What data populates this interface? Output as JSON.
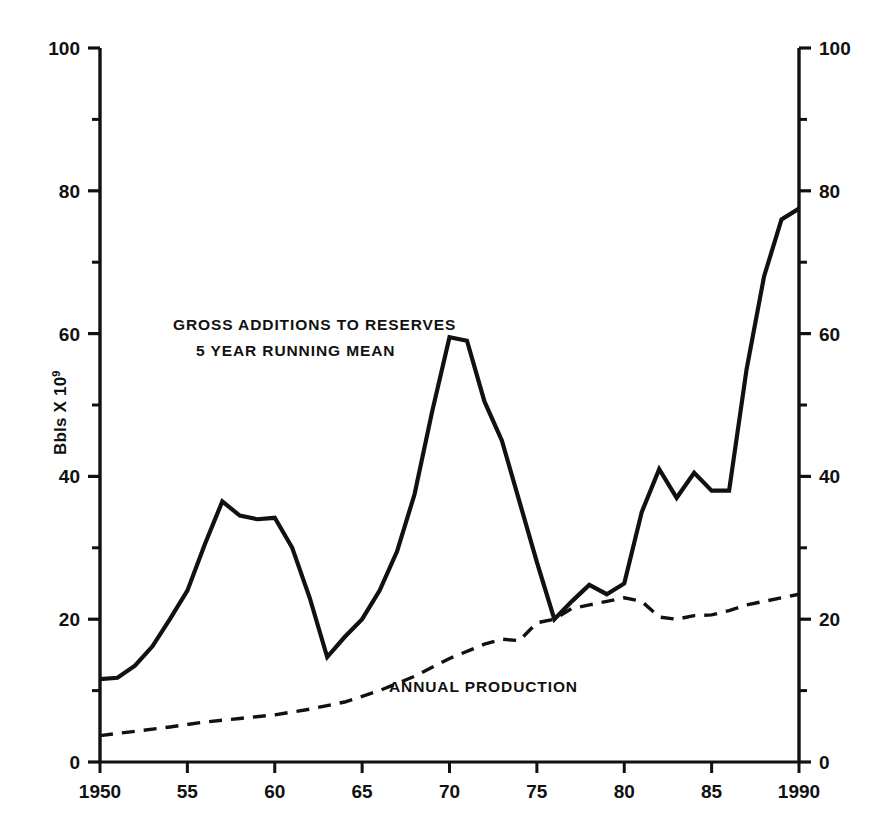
{
  "chart_data": {
    "type": "line",
    "title": "",
    "xlabel": "",
    "ylabel": "Bbls X 10",
    "ylabel_superscript": "9",
    "xlim": [
      1950,
      1990
    ],
    "ylim": [
      0,
      100
    ],
    "xticks": [
      1950,
      1955,
      1960,
      1965,
      1970,
      1975,
      1980,
      1985,
      1990
    ],
    "xticklabels": [
      "1950",
      "55",
      "60",
      "65",
      "70",
      "75",
      "80",
      "85",
      "1990"
    ],
    "yticks": [
      0,
      20,
      40,
      60,
      80,
      100
    ],
    "yticklabels": [
      "0",
      "20",
      "40",
      "60",
      "80",
      "100"
    ],
    "yminorticks": [
      10,
      30,
      50,
      70,
      90
    ],
    "grid": false,
    "legend": "none",
    "dual_y_axis": true,
    "right_axis_same_scale": true,
    "annotations": [
      {
        "name": "series-label-gross-additions",
        "text_line1": "GROSS ADDITIONS TO RESERVES",
        "text_line2": "5 YEAR RUNNING MEAN",
        "x": 1956.5,
        "y": 63.5
      },
      {
        "name": "series-label-annual-production",
        "text": "ANNUAL PRODUCTION",
        "x": 1971.0,
        "y": 10.5
      }
    ],
    "series": [
      {
        "name": "GROSS ADDITIONS TO RESERVES 5 YEAR RUNNING MEAN",
        "style": "solid",
        "x": [
          1950,
          1951,
          1952,
          1953,
          1954,
          1955,
          1956,
          1957,
          1958,
          1959,
          1960,
          1961,
          1962,
          1963,
          1964,
          1965,
          1966,
          1967,
          1968,
          1969,
          1970,
          1971,
          1972,
          1973,
          1974,
          1975,
          1976,
          1977,
          1978,
          1979,
          1980,
          1981,
          1982,
          1983,
          1984,
          1985,
          1986,
          1987,
          1988,
          1989,
          1990
        ],
        "values": [
          11.6,
          11.8,
          13.5,
          16.2,
          20.0,
          24.0,
          30.5,
          36.5,
          34.5,
          34.0,
          34.2,
          30.0,
          23.0,
          14.7,
          17.5,
          20.0,
          24.0,
          29.5,
          37.5,
          49.0,
          59.5,
          59.0,
          50.5,
          45.0,
          36.5,
          28.0,
          20.0,
          22.5,
          24.8,
          23.5,
          25.0,
          35.0,
          41.0,
          37.0,
          40.5,
          38.0,
          38.0,
          55.0,
          68.0,
          76.0,
          77.5
        ]
      },
      {
        "name": "ANNUAL PRODUCTION",
        "style": "dashed",
        "x": [
          1950,
          1952,
          1954,
          1956,
          1958,
          1960,
          1962,
          1964,
          1966,
          1968,
          1970,
          1972,
          1973,
          1974,
          1975,
          1976,
          1977,
          1978,
          1979,
          1980,
          1981,
          1982,
          1983,
          1984,
          1985,
          1986,
          1987,
          1988,
          1989,
          1990
        ],
        "values": [
          3.7,
          4.3,
          4.9,
          5.6,
          6.1,
          6.6,
          7.4,
          8.4,
          10.0,
          12.0,
          14.5,
          16.5,
          17.2,
          17.0,
          19.5,
          20.0,
          21.5,
          22.0,
          22.5,
          23.0,
          22.5,
          20.3,
          20.0,
          20.5,
          20.6,
          21.2,
          22.0,
          22.5,
          23.0,
          23.5
        ]
      }
    ]
  },
  "axes": {
    "left_axis_name": "left-value-axis",
    "right_axis_name": "right-value-axis",
    "bottom_axis_name": "year-axis"
  }
}
